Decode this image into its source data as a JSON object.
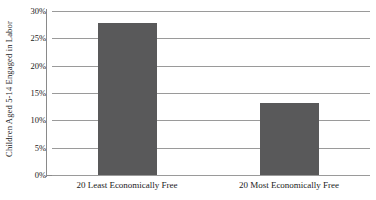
{
  "chart_data": {
    "type": "bar",
    "title": "",
    "xlabel": "",
    "ylabel": "Children Aged 5-14 Engaged in Labor",
    "categories": [
      "20 Least Economically Free",
      "20 Most Economically Free"
    ],
    "values": [
      27.8,
      13.2
    ],
    "value_labels": [
      "27.8%",
      "13.2%"
    ],
    "ylim": [
      0,
      30
    ],
    "yticks": [
      0,
      5,
      10,
      15,
      20,
      25,
      30
    ],
    "ytick_labels": [
      "0%",
      "5%",
      "10%",
      "15%",
      "20%",
      "25%",
      "30%"
    ],
    "grid": true,
    "legend": "none",
    "bar_color": "#59595a",
    "gridline_color": "#9a9a9a",
    "axis_color": "#8a8a8a",
    "background_color": "#ffffff",
    "text_color": "#1a1a1a"
  }
}
